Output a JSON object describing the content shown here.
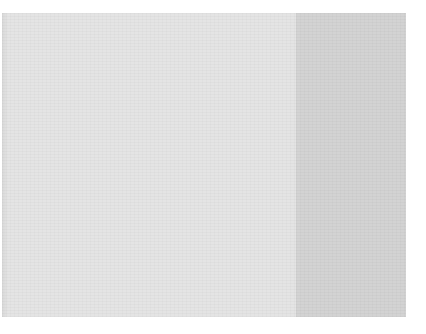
{
  "image": {
    "description": "Blank gray surface with a lighter left region and a darker right strip",
    "colors": {
      "background": "#ffffff",
      "light_panel": "#e4e4e4",
      "dark_panel": "#d3d3d3"
    },
    "regions": [
      {
        "name": "light-panel",
        "x": 2,
        "y": 13,
        "width": 294,
        "height": 304
      },
      {
        "name": "dark-panel",
        "x": 296,
        "y": 13,
        "width": 110,
        "height": 304
      }
    ]
  }
}
